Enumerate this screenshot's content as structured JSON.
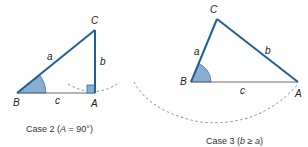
{
  "colors": {
    "side_stroke": "#1f5f9a",
    "angle_fill": "#8aaed0",
    "base_stroke": "#6a6a6a",
    "dash_stroke": "#4a7fb0",
    "text": "#222222"
  },
  "case2": {
    "caption_prefix": "Case 2 (",
    "caption_var": "A",
    "caption_suffix": " = 90°)",
    "vertices": {
      "A": "A",
      "B": "B",
      "C": "C"
    },
    "sides": {
      "a": "a",
      "b": "b",
      "c": "c"
    },
    "right_angle_at": "A",
    "shaded_angle_at": "B"
  },
  "case3": {
    "caption_prefix": "Case 3 (",
    "caption_var_1": "b",
    "caption_rel": " ≥ ",
    "caption_var_2": "a",
    "caption_suffix": ")",
    "vertices": {
      "A": "A",
      "B": "B",
      "C": "C"
    },
    "sides": {
      "a": "a",
      "b": "b",
      "c": "c"
    },
    "shaded_angle_at": "B"
  }
}
